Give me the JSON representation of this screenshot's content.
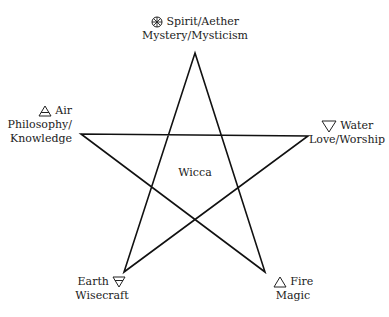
{
  "diagram": {
    "type": "pentagram",
    "center_label": "Wicca",
    "points": {
      "top": {
        "symbol": "spirit-wheel",
        "element": "Spirit/Aether",
        "aspect": "Mystery/Mysticism"
      },
      "left": {
        "symbol": "air-triangle",
        "element": "Air",
        "aspect_line1": "Philosophy/",
        "aspect_line2": "Knowledge"
      },
      "right": {
        "symbol": "water-triangle",
        "element": "Water",
        "aspect": "Love/Worship"
      },
      "bottom_left": {
        "symbol": "earth-triangle",
        "element": "Earth",
        "aspect": "Wisecraft"
      },
      "bottom_right": {
        "symbol": "fire-triangle",
        "element": "Fire",
        "aspect": "Magic"
      }
    },
    "line_color": "#111111"
  }
}
